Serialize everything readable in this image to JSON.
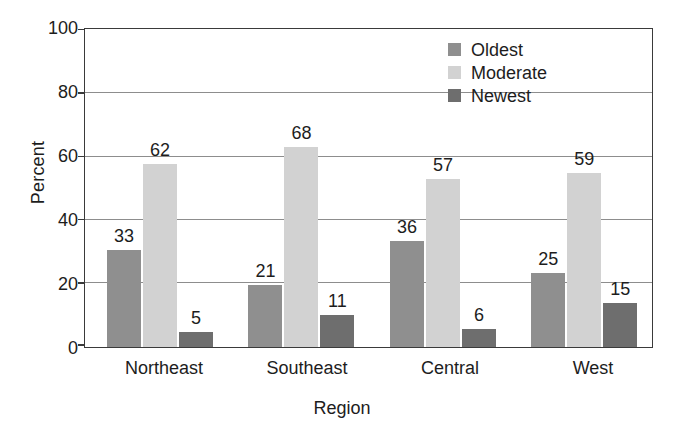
{
  "chart_data": {
    "type": "bar",
    "title": "",
    "subtitle": "",
    "xlabel": "Region",
    "ylabel": "Percent",
    "categories": [
      "Northeast",
      "Southeast",
      "Central",
      "West"
    ],
    "series": [
      {
        "name": "Oldest",
        "values": [
          33,
          21,
          36,
          25
        ],
        "color": "#8f8f8f"
      },
      {
        "name": "Moderate",
        "values": [
          62,
          68,
          57,
          59
        ],
        "color": "#d2d2d2"
      },
      {
        "name": "Newest",
        "values": [
          5,
          11,
          6,
          15
        ],
        "color": "#6e6e6e"
      }
    ],
    "ylim": [
      0,
      100
    ],
    "yticks": [
      0,
      20,
      40,
      60,
      80,
      100
    ],
    "ytick_labels": [
      "0",
      "20",
      "40",
      "60",
      "80",
      "100"
    ],
    "grid": true,
    "grid_axis": "y",
    "legend_position": "top-right-inside",
    "data_labels": true,
    "frame": true,
    "background_color": "#ffffff",
    "axis_color": "#3a3a3a",
    "grid_color": "#8d8d8d",
    "text_color": "#1d1d1d"
  },
  "legend": {
    "entries": [
      {
        "label": "Oldest",
        "color": "#8f8f8f"
      },
      {
        "label": "Moderate",
        "color": "#d2d2d2"
      },
      {
        "label": "Newest",
        "color": "#6e6e6e"
      }
    ]
  },
  "axes": {
    "y_title": "Percent",
    "x_title": "Region",
    "y_tick_labels": [
      "100",
      "80",
      "60",
      "40",
      "20",
      "0"
    ],
    "x_tick_labels": [
      "Northeast",
      "Southeast",
      "Central",
      "West"
    ]
  },
  "bar_labels": {
    "northeast": [
      "33",
      "62",
      "5"
    ],
    "southeast": [
      "21",
      "68",
      "11"
    ],
    "central": [
      "36",
      "57",
      "6"
    ],
    "west": [
      "25",
      "59",
      "15"
    ]
  }
}
